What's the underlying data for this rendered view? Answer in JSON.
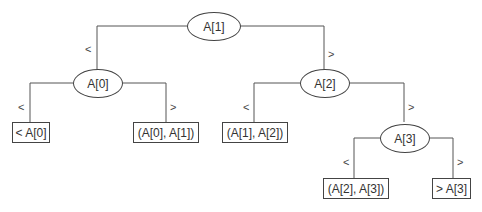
{
  "diagram": {
    "type": "binary-search-tree",
    "nodes": {
      "root": {
        "label": "A[1]"
      },
      "left": {
        "label": "A[0]"
      },
      "right": {
        "label": "A[2]"
      },
      "right_right": {
        "label": "A[3]"
      }
    },
    "leaves": {
      "lt_a0": {
        "label": "< A[0]"
      },
      "a0_a1": {
        "label": "(A[0], A[1])"
      },
      "a1_a2": {
        "label": "(A[1], A[2])"
      },
      "a2_a3": {
        "label": "(A[2], A[3])"
      },
      "gt_a3": {
        "label": "> A[3]"
      }
    },
    "edge_labels": {
      "less": "<",
      "greater": ">"
    },
    "colors": {
      "line": "#444444",
      "text": "#333333",
      "background": "#ffffff"
    }
  }
}
